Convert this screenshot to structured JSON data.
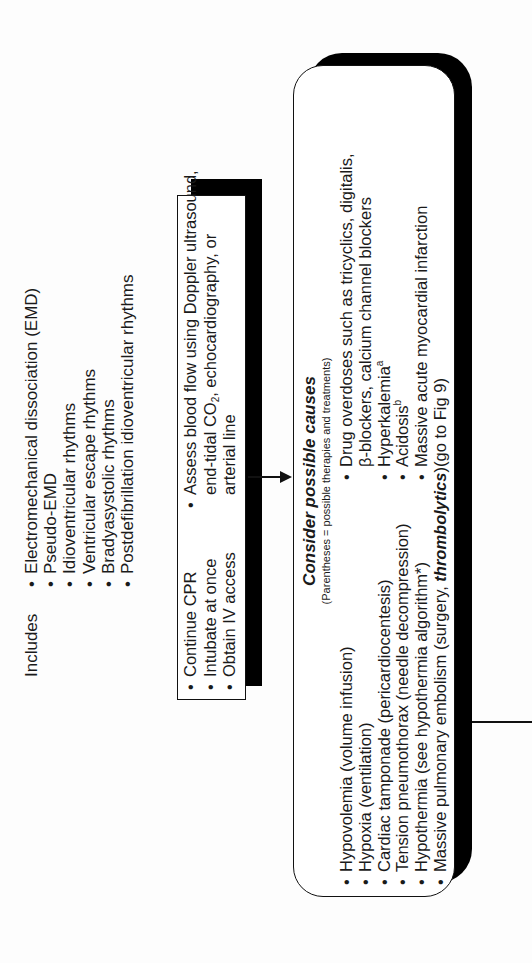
{
  "includes": {
    "label": "Includes",
    "items": [
      "Electromechanical dissociation (EMD)",
      "Pseudo-EMD",
      "Idioventricular rhythms",
      "Ventricular escape rhythms",
      "Bradyasystolic rhythms",
      "Postdefibrillation idioventricular rhythms"
    ]
  },
  "actions_box": {
    "col1": [
      "Continue CPR",
      "Intubate at once",
      "Obtain IV access"
    ],
    "col2": {
      "bullet": "Assess blood flow using Doppler ultrasound,",
      "line2_pre": "end-tidal CO",
      "line2_sub": "2",
      "line2_post": ", echocardiography, or",
      "line3": "arterial line"
    }
  },
  "causes_box": {
    "title": "Consider possible causes",
    "subtitle": "(Parentheses = possible therapies and treatments)",
    "left": [
      "Hypovolemia (volume infusion)",
      "Hypoxia (ventilation)",
      "Cardiac tamponade (pericardiocentesis)",
      "Tension pneumothorax (needle decompression)",
      "Hypothermia (see hypothermia algorithm*)"
    ],
    "left_last_pre": "Massive pulmonary embolism (surgery, ",
    "left_last_bold": "thrombolytics",
    "left_last_post": ")",
    "right": {
      "drug_line1": "Drug overdoses such as tricyclics, digitalis,",
      "drug_line2": "β-blockers, calcium channel blockers",
      "hyperkalemia": "Hyperkalemia",
      "hyperkalemia_sup": "a",
      "acidosis": "Acidosis",
      "acidosis_sup": "b",
      "mi_line1": "Massive acute myocardial infarction",
      "mi_line2": "(go to Fig 9)"
    }
  }
}
